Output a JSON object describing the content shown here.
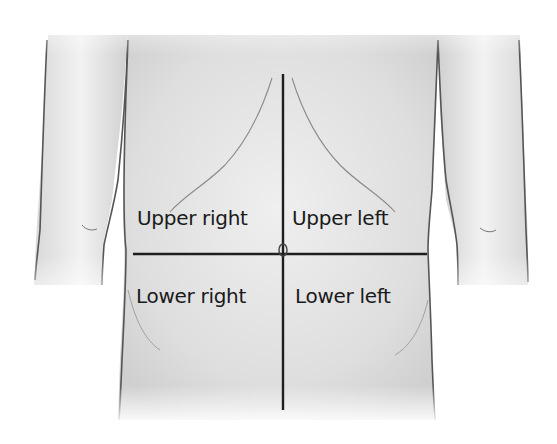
{
  "diagram": {
    "quadrants": [
      {
        "id": "upper-right",
        "label": "Upper right"
      },
      {
        "id": "upper-left",
        "label": "Upper left"
      },
      {
        "id": "lower-right",
        "label": "Lower right"
      },
      {
        "id": "lower-left",
        "label": "Lower left"
      }
    ],
    "colors": {
      "background": "#ffffff",
      "skin": "#e4e4e4",
      "outline": "#555555",
      "divider": "#1e1e1e",
      "text": "#1a1a1a"
    }
  }
}
